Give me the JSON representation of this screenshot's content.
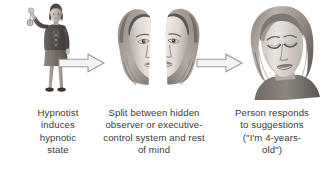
{
  "figure": {
    "type": "process-diagram",
    "orientation": "horizontal",
    "background_color": "#ffffff",
    "text_color": "#3a3a3a",
    "palette": {
      "ink": "#3a3a3a",
      "arrow_stroke": "#9a9a9a",
      "arrow_fill": "#f2f2f2",
      "skin_light": "#e8e3df",
      "skin_mid": "#cfc7c1",
      "skin_shadow": "#a89f99",
      "hair_light": "#b8b2ac",
      "hair_dark": "#6e6862",
      "suit_dark": "#55504c",
      "suit_mid": "#7a736d",
      "outline": "#4a4542"
    }
  },
  "panels": [
    {
      "id": "panel-hypnotist",
      "art_name": "hypnotist-figure-illustration",
      "art_description": "standing woman in dark jacket and skirt holding a swinging pendulum above her head",
      "caption_lines": [
        "Hypnotist",
        "induces",
        "hypnotic",
        "state"
      ]
    },
    {
      "id": "panel-split-mind",
      "art_name": "split-face-illustration",
      "art_description": "woman's face split vertically into two separated halves",
      "caption_lines": [
        "Split between hidden",
        "observer or executive-",
        "control system and rest",
        "of mind"
      ]
    },
    {
      "id": "panel-response",
      "art_name": "entranced-face-illustration",
      "art_description": "woman's face with eyes closed in a hypnotic trance",
      "caption_lines": [
        "Person responds",
        "to suggestions",
        "(\"I'm 4-years-",
        "old\")"
      ]
    }
  ],
  "arrows": [
    {
      "id": "arrow-1",
      "name": "arrow-right-icon",
      "direction": "right"
    },
    {
      "id": "arrow-2",
      "name": "arrow-right-icon",
      "direction": "right"
    }
  ]
}
